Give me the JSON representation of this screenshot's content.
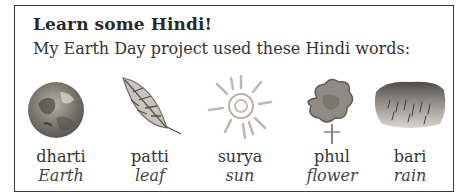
{
  "panel": {
    "title": "Learn some Hindi!",
    "intro": "My Earth Day project used these Hindi words:"
  },
  "words": [
    {
      "hindi": "dharti",
      "english": "Earth",
      "icon": "earth-painting-icon"
    },
    {
      "hindi": "patti",
      "english": "leaf",
      "icon": "leaf-painting-icon"
    },
    {
      "hindi": "surya",
      "english": "sun",
      "icon": "sun-painting-icon"
    },
    {
      "hindi": "phul",
      "english": "flower",
      "icon": "flower-painting-icon"
    },
    {
      "hindi": "bari",
      "english": "rain",
      "icon": "rain-painting-icon"
    }
  ]
}
